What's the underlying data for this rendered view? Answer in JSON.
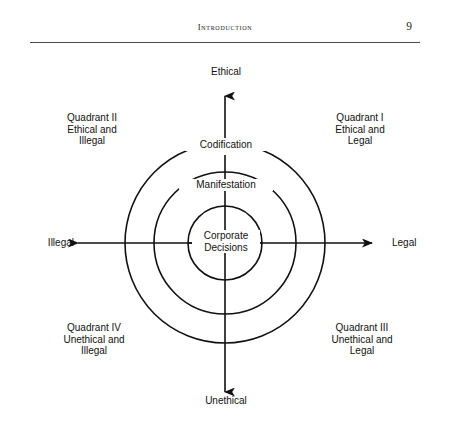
{
  "header": {
    "title": "Introduction",
    "page_number": "9"
  },
  "figure": {
    "axis_labels": {
      "top": "Ethical",
      "bottom": "Unethical",
      "left": "Illegal",
      "right": "Legal"
    },
    "rings": [
      {
        "name": "outer",
        "label": "Codification"
      },
      {
        "name": "middle",
        "label": "Manifestation"
      },
      {
        "name": "inner",
        "label": "Corporate\nDecisions"
      }
    ],
    "quadrants": [
      {
        "id": "q1",
        "label": "Quadrant I\nEthical and\nLegal"
      },
      {
        "id": "q2",
        "label": "Quadrant II\nEthical and\nIllegal"
      },
      {
        "id": "q3",
        "label": "Quadrant III\nUnethical and\nLegal"
      },
      {
        "id": "q4",
        "label": "Quadrant IV\nUnethical and\nIllegal"
      }
    ],
    "colors": {
      "stroke": "#111111",
      "background": "#ffffff",
      "text": "#111111"
    }
  },
  "footer": {
    "cut_off_text": ""
  }
}
